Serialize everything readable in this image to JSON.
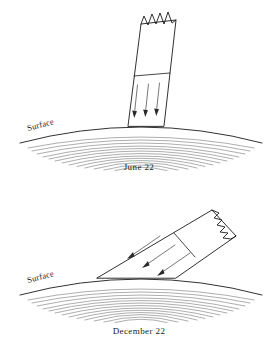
{
  "figure": {
    "title_present": false,
    "background_color": "#ffffff",
    "ink_color": "#1a1a1a",
    "width": 279,
    "height": 348
  },
  "panels": [
    {
      "id": "summer-solstice",
      "caption": "June 22",
      "surface_label": "Surface",
      "beam_orientation": "near-vertical",
      "beam_description": "narrow sunlight beam striking surface at a steep angle",
      "beam_top_edge": "jagged",
      "arrow_count": 3,
      "arrow_direction": "downward",
      "footprint_width_relative": "narrow",
      "surface_arc": {
        "start_x": 20,
        "start_y": 143,
        "apex_x": 141,
        "apex_y": 121,
        "end_x": 262,
        "end_y": 143
      },
      "beam_contact": {
        "left_x": 127,
        "right_x": 164,
        "y": 126
      },
      "hatching_bands": 13
    },
    {
      "id": "winter-solstice",
      "caption": "December 22",
      "surface_label": "Surface",
      "beam_orientation": "oblique",
      "beam_description": "narrow sunlight beam striking surface at a shallow angle, spreading energy over a wider footprint",
      "beam_top_edge": "jagged",
      "arrow_count": 3,
      "arrow_direction": "downward-left",
      "footprint_width_relative": "wide",
      "surface_arc": {
        "start_x": 20,
        "start_y": 295,
        "apex_x": 141,
        "apex_y": 273,
        "end_x": 262,
        "end_y": 295
      },
      "beam_contact": {
        "left_x": 97,
        "right_x": 176,
        "y": 278
      },
      "hatching_bands": 13
    }
  ],
  "colors": {
    "ink": "#1a1a1a",
    "hatch": "#4a4a4a",
    "arrow": "#3c3c3c",
    "beam_fill": "#ffffff",
    "background": "#ffffff"
  }
}
